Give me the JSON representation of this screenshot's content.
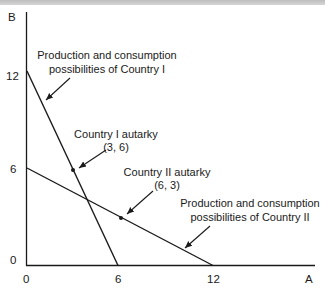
{
  "diagram": {
    "type": "production-possibilities",
    "axes": {
      "x_label": "A",
      "y_label": "B",
      "x_ticks": [
        "0",
        "6",
        "12"
      ],
      "y_ticks": [
        "0",
        "6",
        "12"
      ]
    },
    "lines": [
      {
        "name": "Country I",
        "from": [
          0,
          12
        ],
        "to": [
          6,
          0
        ],
        "label_line1": "Production and consumption",
        "label_line2": "possibilities of Country I"
      },
      {
        "name": "Country II",
        "from": [
          0,
          6
        ],
        "to": [
          12,
          0
        ],
        "label_line1": "Production and consumption",
        "label_line2": "possibilities of Country II"
      }
    ],
    "points": [
      {
        "name": "Country I autarky",
        "coords": [
          3,
          6
        ],
        "label_line1": "Country I autarky",
        "label_line2": "(3, 6)"
      },
      {
        "name": "Country II autarky",
        "coords": [
          6,
          3
        ],
        "label_line1": "Country II autarky",
        "label_line2": "(6, 3)"
      }
    ],
    "colors": {
      "ink": "#1a1a1a",
      "background": "#ffffff",
      "top_strip": "#c8c8c8"
    }
  }
}
